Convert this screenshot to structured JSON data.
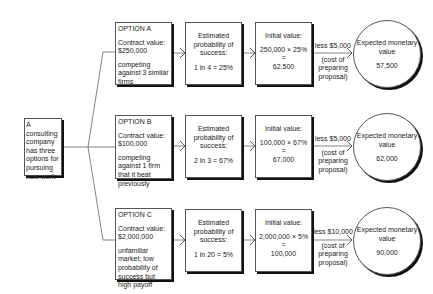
{
  "root": {
    "text": "A consulting company has three options for pursuing new work"
  },
  "options": [
    {
      "title": "OPTION A",
      "contract": "Contract value: $250,000",
      "note": "competing against 3 similar firms",
      "prob_heading": "Estimated probability of success:",
      "prob_value": "1 in 4 = 25%",
      "init_heading": "Initial value:",
      "init_calc": "250,000 × 25%",
      "init_eq": "=",
      "init_result": "62,500",
      "less": "less $5,000",
      "less_note": "(cost of preparing proposal)",
      "emv_heading": "Expected monetary value",
      "emv_value": "57,500"
    },
    {
      "title": "OPTION B",
      "contract": "Contract value: $100,000",
      "note": "competing against 1 firm that it beat previously",
      "prob_heading": "Estimated probability of success:",
      "prob_value": "2 in 3 = 67%",
      "init_heading": "Initial value:",
      "init_calc": "100,000 × 67%",
      "init_eq": "=",
      "init_result": "67,000",
      "less": "less $5,000",
      "less_note": "(cost of preparing proposal)",
      "emv_heading": "Expected monetary value",
      "emv_value": "62,000"
    },
    {
      "title": "OPTION C",
      "contract": "Contract value: $2,000,000",
      "note": "unfamiliar market; low probability of success but high payoff",
      "prob_heading": "Estimated probability of success:",
      "prob_value": "1 in 20 = 5%",
      "init_heading": "Initial value:",
      "init_calc": "2,000,000 × 5%",
      "init_eq": "=",
      "init_result": "100,000",
      "less": "less $10,000",
      "less_note": "(cost of preparing proposal)",
      "emv_heading": "Expected monetary value",
      "emv_value": "90,000"
    }
  ]
}
